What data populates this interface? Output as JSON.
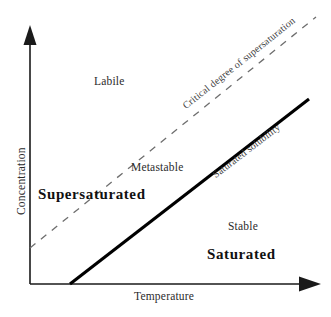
{
  "diagram": {
    "axes": {
      "x_label": "Temperature",
      "y_label": "Concentration"
    },
    "regions": [
      {
        "key": "labile",
        "label": "Labile",
        "style": "plain"
      },
      {
        "key": "metastable",
        "label": "Metastable",
        "style": "plain"
      },
      {
        "key": "stable",
        "label": "Stable",
        "style": "plain"
      },
      {
        "key": "supersaturated",
        "label": "Supersaturated",
        "style": "bold"
      },
      {
        "key": "saturated",
        "label": "Saturated",
        "style": "bold"
      }
    ],
    "curves": [
      {
        "key": "critical_supersaturation",
        "label": "Critical degree of supersaturation",
        "stroke": "dashed",
        "color": "#6e6e6e"
      },
      {
        "key": "saturated_solubility",
        "label": "Saturated solubility",
        "stroke": "solid",
        "color": "#000000"
      }
    ],
    "colors": {
      "background": "#ffffff",
      "axis": "#1a1a1a",
      "solid_curve": "#000000",
      "dashed_curve": "#6e6e6e",
      "text": "#1a1a1a"
    }
  }
}
